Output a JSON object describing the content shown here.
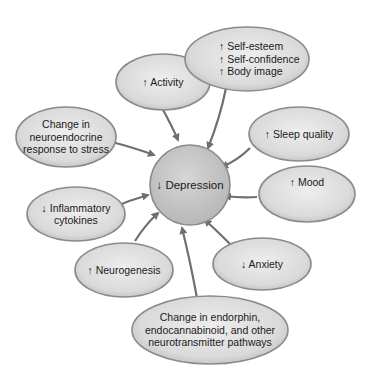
{
  "center": {
    "label": "↓ Depression"
  },
  "nodes": [
    {
      "id": "activity",
      "label": "↑ Activity"
    },
    {
      "id": "self",
      "label": "↑ Self-esteem\n↑ Self-confidence\n↑ Body image"
    },
    {
      "id": "neuroendocrine",
      "label": "Change in\nneuroendocrine\nresponse to stress"
    },
    {
      "id": "sleep",
      "label": "↑ Sleep quality"
    },
    {
      "id": "mood",
      "label": "↑ Mood"
    },
    {
      "id": "inflammatory",
      "label": "↓ Inflammatory\ncytokines"
    },
    {
      "id": "neurogenesis",
      "label": "↑ Neurogenesis"
    },
    {
      "id": "anxiety",
      "label": "↓ Anxiety"
    },
    {
      "id": "endorphin",
      "label": "Change in endorphin,\nendocannabinoid, and other\nneurotransmitter pathways"
    }
  ],
  "colors": {
    "fill": "#dcdcdc",
    "stroke": "#8a8a8a",
    "center_fill": "#c8c8c8",
    "arrow": "#6f6f6f"
  }
}
